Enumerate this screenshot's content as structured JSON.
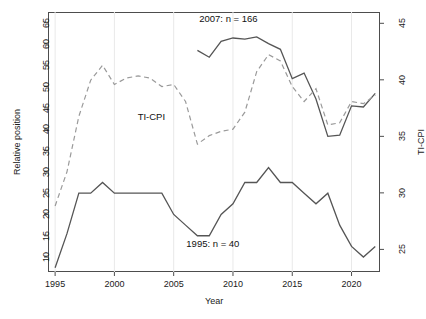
{
  "chart_data": {
    "type": "line",
    "title": "",
    "xlabel": "Year",
    "ylabel": "Relative position",
    "y2label": "TI-CPI",
    "xlim": [
      1994.4,
      2022.4
    ],
    "ylim": [
      6.5,
      67.5
    ],
    "y2lim": [
      23.0,
      46.0
    ],
    "grid": true,
    "grid_axis": "x",
    "legend_position": "inline-annotations",
    "xticks": [
      1995,
      2000,
      2005,
      2010,
      2015,
      2020
    ],
    "xticklabels": [
      "1995",
      "2000",
      "2005",
      "2010",
      "2015",
      "2020"
    ],
    "yticks": [
      10,
      15,
      20,
      25,
      30,
      35,
      40,
      45,
      50,
      55,
      60,
      65
    ],
    "yticklabels": [
      "10",
      "15",
      "20",
      "25",
      "30",
      "35",
      "40",
      "45",
      "50",
      "55",
      "60",
      "65"
    ],
    "y2ticks": [
      25,
      30,
      35,
      40,
      45
    ],
    "y2ticklabels": [
      "25",
      "30",
      "35",
      "40",
      "45"
    ],
    "annotations": [
      {
        "text": "2007: n = 166",
        "x": 2009.6,
        "y": 66.0
      },
      {
        "text": "TI-CPI",
        "x": 2003.1,
        "y": 43.0
      },
      {
        "text": "1995: n = 40",
        "x": 2008.3,
        "y": 13.2
      }
    ],
    "series": [
      {
        "name": "1995: n = 40",
        "style": "solid",
        "color": "#555555",
        "axis": "left",
        "x": [
          1995,
          1996,
          1997,
          1998,
          1999,
          2000,
          2001,
          2002,
          2003,
          2004,
          2005,
          2006,
          2007,
          2008,
          2009,
          2010,
          2011,
          2012,
          2013,
          2014,
          2015,
          2016,
          2017,
          2018,
          2019,
          2020,
          2021,
          2022
        ],
        "y": [
          7.5,
          15.5,
          25.0,
          25.0,
          27.5,
          25.0,
          25.0,
          25.0,
          25.0,
          25.0,
          20.0,
          17.5,
          15.0,
          15.0,
          20.0,
          22.5,
          27.5,
          27.5,
          31.0,
          27.5,
          27.5,
          25.0,
          22.5,
          25.0,
          17.5,
          12.5,
          10.0,
          12.5
        ]
      },
      {
        "name": "2007: n = 166",
        "style": "solid",
        "color": "#555555",
        "axis": "right",
        "x": [
          2007,
          2008,
          2009,
          2010,
          2011,
          2012,
          2013,
          2014,
          2015,
          2016,
          2017,
          2018,
          2019,
          2020,
          2021,
          2022
        ],
        "y": [
          42.6,
          42.0,
          43.4,
          43.7,
          43.6,
          43.8,
          43.2,
          42.7,
          40.1,
          40.6,
          38.3,
          35.0,
          35.1,
          37.7,
          37.6,
          38.8
        ]
      },
      {
        "name": "TI-CPI",
        "style": "dashed",
        "color": "#9a9a9a",
        "axis": "left",
        "x": [
          1995,
          1996,
          1997,
          1998,
          1999,
          2000,
          2001,
          2002,
          2003,
          2004,
          2005,
          2006,
          2007,
          2008,
          2009,
          2010,
          2011,
          2012,
          2013,
          2014,
          2015,
          2016,
          2017,
          2018,
          2019,
          2020,
          2021,
          2022
        ],
        "y": [
          22.0,
          30.0,
          43.0,
          51.5,
          55.0,
          50.5,
          52.0,
          52.5,
          52.0,
          50.0,
          50.5,
          46.5,
          36.5,
          38.5,
          39.5,
          40.0,
          44.0,
          53.5,
          57.5,
          56.0,
          50.0,
          46.5,
          49.5,
          41.0,
          41.5,
          46.5,
          46.0,
          48.0
        ]
      }
    ]
  },
  "plot": {
    "left": 48,
    "right": 380,
    "top": 12,
    "bottom": 272
  }
}
